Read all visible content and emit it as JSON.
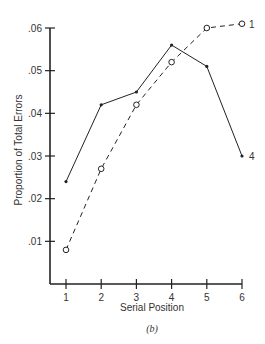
{
  "chart_data": {
    "type": "line",
    "title": "",
    "caption": "(b)",
    "xlabel": "Serial Position",
    "ylabel": "Proportion of Total Errors",
    "x": [
      1,
      2,
      3,
      4,
      5,
      6
    ],
    "x_tick_labels": [
      "1",
      "2",
      "3",
      "4",
      "5",
      "6"
    ],
    "y_tick_labels": [
      ".01",
      ".02",
      ".03",
      ".04",
      ".05",
      ".06"
    ],
    "y_ticks": [
      0.01,
      0.02,
      0.03,
      0.04,
      0.05,
      0.06
    ],
    "ylim": [
      0,
      0.06
    ],
    "xlim": [
      0.5,
      6
    ],
    "grid": false,
    "series": [
      {
        "name": "4",
        "style": "solid",
        "marker": "filled-dot",
        "end_label": "4",
        "values": [
          0.024,
          0.042,
          0.045,
          0.056,
          0.051,
          0.03
        ]
      },
      {
        "name": "1",
        "style": "dashed",
        "marker": "open-circle",
        "end_label": "1",
        "values": [
          0.008,
          0.027,
          0.042,
          0.052,
          0.06,
          0.061
        ]
      }
    ]
  }
}
